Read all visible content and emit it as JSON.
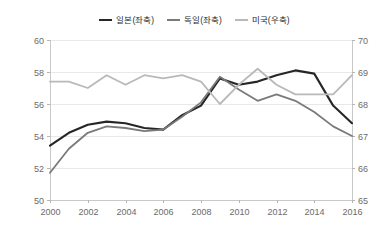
{
  "chart_data": {
    "type": "line",
    "title": "",
    "xlabel": "",
    "ylabel": "",
    "x": [
      2000,
      2001,
      2002,
      2003,
      2004,
      2005,
      2006,
      2007,
      2008,
      2009,
      2010,
      2011,
      2012,
      2013,
      2014,
      2015,
      2016
    ],
    "xtick_labels": [
      "2000",
      "2002",
      "2004",
      "2006",
      "2008",
      "2010",
      "2012",
      "2014",
      "2016"
    ],
    "xticks": [
      2000,
      2002,
      2004,
      2006,
      2008,
      2010,
      2012,
      2014,
      2016
    ],
    "xlim": [
      2000,
      2016
    ],
    "left_axis": {
      "label": "",
      "ylim": [
        50,
        60
      ],
      "ticks": [
        50,
        52,
        54,
        56,
        58,
        60
      ],
      "tick_labels": [
        "50",
        "52",
        "54",
        "56",
        "58",
        "60"
      ]
    },
    "right_axis": {
      "label": "",
      "ylim": [
        65,
        70
      ],
      "ticks": [
        65,
        66,
        67,
        68,
        69,
        70
      ],
      "tick_labels": [
        "65",
        "66",
        "67",
        "68",
        "69",
        "70"
      ]
    },
    "grid": true,
    "legend_position": "top-center",
    "series": [
      {
        "name": "일본(좌축)",
        "axis": "left",
        "color": "#262626",
        "width": 2.1,
        "values": [
          53.4,
          54.2,
          54.7,
          54.9,
          54.8,
          54.5,
          54.4,
          55.3,
          55.9,
          57.6,
          57.2,
          57.4,
          57.8,
          58.1,
          57.9,
          55.9,
          54.8
        ]
      },
      {
        "name": "독일(좌축)",
        "axis": "left",
        "color": "#7a7a7a",
        "width": 1.8,
        "values": [
          51.7,
          53.2,
          54.2,
          54.6,
          54.5,
          54.3,
          54.4,
          55.2,
          56.1,
          57.7,
          56.9,
          56.2,
          56.6,
          56.2,
          55.5,
          54.6,
          54.0
        ]
      },
      {
        "name": "미국(우축)",
        "axis": "right",
        "color": "#b9b9b9",
        "width": 1.8,
        "values": [
          68.7,
          68.7,
          68.5,
          68.9,
          68.6,
          68.9,
          68.8,
          68.9,
          68.7,
          68.0,
          68.6,
          69.1,
          68.6,
          68.3,
          68.3,
          68.3,
          68.9
        ]
      }
    ]
  },
  "legend": {
    "entries": [
      {
        "label": "일본(좌축)",
        "color": "#262626"
      },
      {
        "label": "독일(좌축)",
        "color": "#7a7a7a"
      },
      {
        "label": "미국(우축)",
        "color": "#b9b9b9"
      }
    ]
  }
}
